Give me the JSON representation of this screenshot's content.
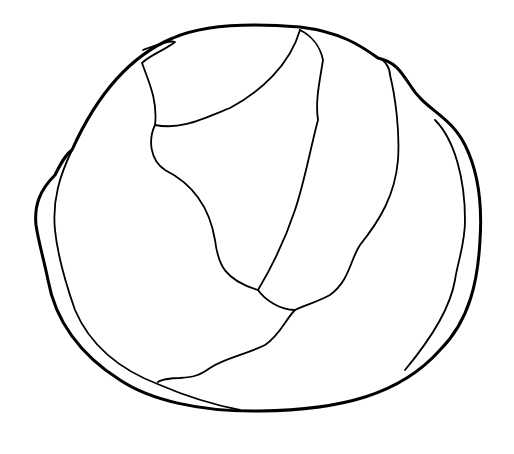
{
  "image": {
    "subject": "cabbage line drawing",
    "background": "#ffffff",
    "stroke_color": "#000000"
  }
}
